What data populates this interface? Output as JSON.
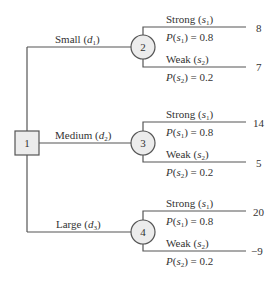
{
  "diagram": {
    "type": "decision-tree",
    "decision_node": {
      "id": "1",
      "shape": "square"
    },
    "decisions": [
      {
        "label": "Small",
        "symbol": "d",
        "subscript": "1",
        "chance_node": "2",
        "outcomes": [
          {
            "label": "Strong",
            "symbol": "s",
            "subscript": "1",
            "prob_text": "P(s1) = 0.8",
            "prob_value": "0.8",
            "payoff": "8"
          },
          {
            "label": "Weak",
            "symbol": "s",
            "subscript": "2",
            "prob_text": "P(s2) = 0.2",
            "prob_value": "0.2",
            "payoff": "7"
          }
        ]
      },
      {
        "label": "Medium",
        "symbol": "d",
        "subscript": "2",
        "chance_node": "3",
        "outcomes": [
          {
            "label": "Strong",
            "symbol": "s",
            "subscript": "1",
            "prob_text": "P(s1) = 0.8",
            "prob_value": "0.8",
            "payoff": "14"
          },
          {
            "label": "Weak",
            "symbol": "s",
            "subscript": "2",
            "prob_text": "P(s2) = 0.2",
            "prob_value": "0.2",
            "payoff": "5"
          }
        ]
      },
      {
        "label": "Large",
        "symbol": "d",
        "subscript": "3",
        "chance_node": "4",
        "outcomes": [
          {
            "label": "Strong",
            "symbol": "s",
            "subscript": "1",
            "prob_text": "P(s1) = 0.8",
            "prob_value": "0.8",
            "payoff": "20"
          },
          {
            "label": "Weak",
            "symbol": "s",
            "subscript": "2",
            "prob_text": "P(s2) = 0.2",
            "prob_value": "0.2",
            "payoff": "−9"
          }
        ]
      }
    ],
    "colors": {
      "line": "#555555",
      "node_fill": "#ececec",
      "text": "#333333"
    }
  }
}
